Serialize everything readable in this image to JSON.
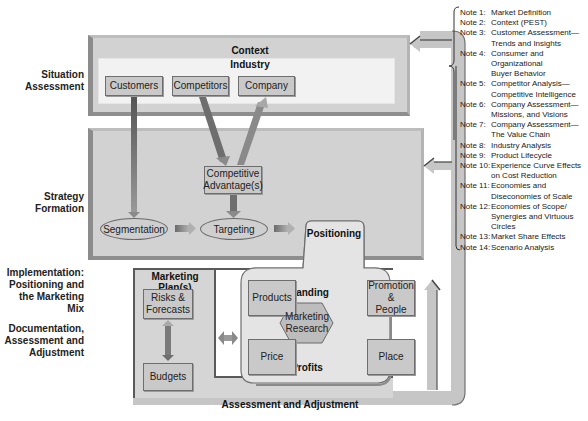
{
  "stages": [
    {
      "id": "situation",
      "label": "Situation\nAssessment"
    },
    {
      "id": "strategy",
      "label": "Strategy\nFormation"
    },
    {
      "id": "implementation",
      "label": "Implementation:\nPositioning and\nthe Marketing Mix"
    },
    {
      "id": "documentation",
      "label": "Documentation,\nAssessment and\nAdjustment"
    }
  ],
  "situation_panel": {
    "title": "Context",
    "subtitle": "Industry",
    "boxes": [
      "Customers",
      "Competitors",
      "Company"
    ]
  },
  "strategy_panel": {
    "competitive_advantage": "Competitive\nAdvantage(s)",
    "segmentation": "Segmentation",
    "targeting": "Targeting"
  },
  "positioning_panel": {
    "title": "Positioning",
    "branding": "Branding",
    "profits": "Profits",
    "products": "Products",
    "promotion": "Promotion\n&\nPeople",
    "price": "Price",
    "place": "Place",
    "research": "Marketing\nResearch"
  },
  "marketing_plan": {
    "title": "Marketing Plan(s)",
    "risks": "Risks &\nForecasts",
    "budgets": "Budgets"
  },
  "feedback_loop": {
    "label": "Assessment and Adjustment"
  },
  "notes": [
    {
      "num": "Note 1:",
      "text": "Market Definition"
    },
    {
      "num": "Note 2:",
      "text": "Context (PEST)"
    },
    {
      "num": "Note 3:",
      "text": "Customer Assessment—\nTrends and Insights"
    },
    {
      "num": "Note 4:",
      "text": "Consumer and\nOrganizational\nBuyer Behavior"
    },
    {
      "num": "Note 5:",
      "text": "Competitor Analysis—\nCompetitive Intelligence"
    },
    {
      "num": "Note 6:",
      "text": "Company Assessment—\nMissions, and Visions"
    },
    {
      "num": "Note 7:",
      "text": "Company Assessment—\nThe Value Chain"
    },
    {
      "num": "Note 8:",
      "text": "Industry Analysis"
    },
    {
      "num": "Note 9:",
      "text": "Product Lifecycle"
    },
    {
      "num": "Note 10:",
      "text": "Experience Curve Effects\non Cost Reduction"
    },
    {
      "num": "Note 11:",
      "text": "Economies and\nDiseconomies of Scale"
    },
    {
      "num": "Note 12:",
      "text": "Economies of Scope/\nSynergies and Virtuous\nCircles"
    },
    {
      "num": "Note 13:",
      "text": "Market Share Effects"
    },
    {
      "num": "Note 14:",
      "text": "Scenario Analysis"
    }
  ],
  "colors": {
    "panel": "#d2d2d2",
    "panel_dark_edge": "#8c8c8c",
    "box": "#c9c9c9",
    "inner": "#f2f2f2",
    "loop": "#c4c4c4"
  }
}
